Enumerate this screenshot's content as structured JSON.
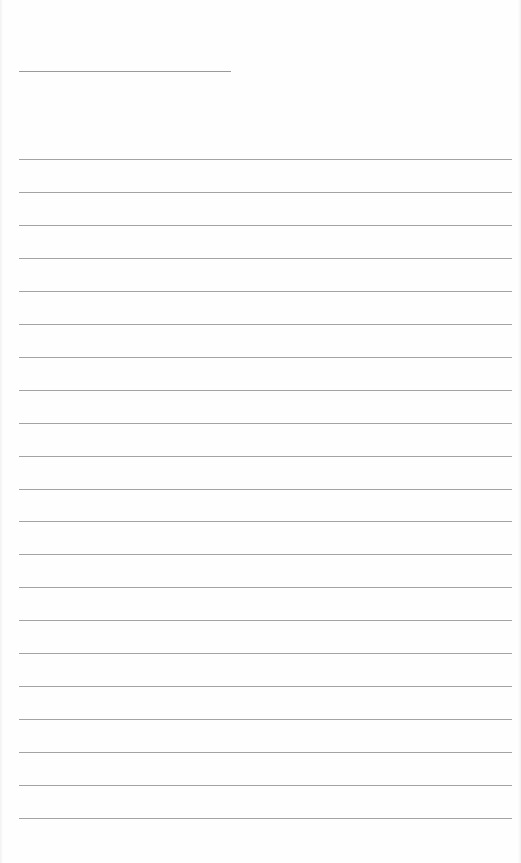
{
  "document": {
    "type": "lined-paper",
    "background_color": "#fefefe",
    "line_color": "#a3a3a3",
    "header_line": {
      "x": 19,
      "y": 71,
      "width": 212
    },
    "ruled_lines": {
      "count": 21,
      "first_y": 159,
      "spacing": 32.95,
      "x": 19,
      "width": 493
    }
  }
}
